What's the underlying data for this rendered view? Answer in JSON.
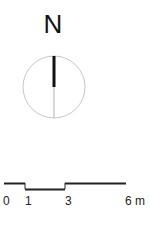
{
  "north_arrow": {
    "label": "N",
    "circle": {
      "cx": 54,
      "cy": 87,
      "r": 31,
      "stroke": "#c8c8c8"
    },
    "needle_color": "#111111",
    "tail_color": "#b0b0b0"
  },
  "scale_bar": {
    "ticks": [
      {
        "label": "0",
        "x": 3
      },
      {
        "label": "1",
        "x": 25
      },
      {
        "label": "3",
        "x": 65
      },
      {
        "label": "6 m",
        "x": 125
      }
    ],
    "unit": "m",
    "line_color": "#222222"
  }
}
